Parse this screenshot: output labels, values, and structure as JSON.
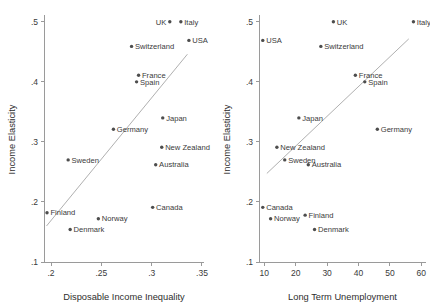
{
  "figure": {
    "panels": [
      {
        "id": "left",
        "xlabel": "Disposable Income Inequality",
        "ylabel": "Income Elasticity",
        "xticks": [
          ".2",
          ".25",
          ".3",
          ".35"
        ],
        "xtickvals": [
          0.2,
          0.25,
          0.3,
          0.35
        ],
        "yticks": [
          ".1",
          ".2",
          ".3",
          ".4",
          ".5"
        ],
        "ytickvals": [
          0.1,
          0.2,
          0.3,
          0.4,
          0.5
        ]
      },
      {
        "id": "right",
        "xlabel": "Long Term Unemployment",
        "ylabel": "Income Elasticity",
        "xticks": [
          "10",
          "20",
          "30",
          "40",
          "50",
          "60"
        ],
        "xtickvals": [
          10,
          20,
          30,
          40,
          50,
          60
        ],
        "yticks": [
          ".1",
          ".2",
          ".3",
          ".4",
          ".5"
        ],
        "ytickvals": [
          0.1,
          0.2,
          0.3,
          0.4,
          0.5
        ]
      }
    ]
  },
  "chart_data": [
    {
      "type": "scatter",
      "panel": "left",
      "title": "",
      "xlabel": "Disposable Income Inequality",
      "ylabel": "Income Elasticity",
      "xlim": [
        0.193,
        0.352
      ],
      "ylim": [
        0.1,
        0.508
      ],
      "grid": false,
      "legend": false,
      "point_labels": true,
      "fit_line": {
        "x": [
          0.1955,
          0.3355
        ],
        "y": [
          0.16,
          0.446
        ]
      },
      "points": [
        {
          "label": "UK",
          "x": 0.318,
          "y": 0.5,
          "side": "left"
        },
        {
          "label": "Italy",
          "x": 0.329,
          "y": 0.5,
          "side": "right"
        },
        {
          "label": "USA",
          "x": 0.337,
          "y": 0.469,
          "side": "right"
        },
        {
          "label": "Switzerland",
          "x": 0.28,
          "y": 0.459,
          "side": "right"
        },
        {
          "label": "France",
          "x": 0.287,
          "y": 0.411,
          "side": "right"
        },
        {
          "label": "Spain",
          "x": 0.285,
          "y": 0.4,
          "side": "right"
        },
        {
          "label": "Japan",
          "x": 0.311,
          "y": 0.34,
          "side": "right"
        },
        {
          "label": "Germany",
          "x": 0.262,
          "y": 0.321,
          "side": "right"
        },
        {
          "label": "New Zealand",
          "x": 0.31,
          "y": 0.291,
          "side": "right"
        },
        {
          "label": "Australia",
          "x": 0.304,
          "y": 0.262,
          "side": "right"
        },
        {
          "label": "Sweden",
          "x": 0.217,
          "y": 0.27,
          "side": "right"
        },
        {
          "label": "Canada",
          "x": 0.301,
          "y": 0.191,
          "side": "right"
        },
        {
          "label": "Finland",
          "x": 0.196,
          "y": 0.182,
          "side": "right"
        },
        {
          "label": "Norway",
          "x": 0.247,
          "y": 0.172,
          "side": "right"
        },
        {
          "label": "Denmark",
          "x": 0.219,
          "y": 0.154,
          "side": "right"
        }
      ]
    },
    {
      "type": "scatter",
      "panel": "right",
      "title": "",
      "xlabel": "Long Term Unemployment",
      "ylabel": "Income Elasticity",
      "xlim": [
        8.3,
        61.5
      ],
      "ylim": [
        0.1,
        0.508
      ],
      "grid": false,
      "legend": false,
      "point_labels": true,
      "fit_line": {
        "x": [
          10.8,
          56.0
        ],
        "y": [
          0.2475,
          0.4715
        ]
      },
      "points": [
        {
          "label": "UK",
          "x": 32.0,
          "y": 0.5,
          "side": "right"
        },
        {
          "label": "Italy",
          "x": 57.5,
          "y": 0.5,
          "side": "right"
        },
        {
          "label": "USA",
          "x": 9.5,
          "y": 0.469,
          "side": "right"
        },
        {
          "label": "Switzerland",
          "x": 28.0,
          "y": 0.459,
          "side": "right"
        },
        {
          "label": "France",
          "x": 39.0,
          "y": 0.411,
          "side": "right"
        },
        {
          "label": "Spain",
          "x": 42.0,
          "y": 0.4,
          "side": "right"
        },
        {
          "label": "Germany",
          "x": 46.0,
          "y": 0.321,
          "side": "right"
        },
        {
          "label": "Japan",
          "x": 21.0,
          "y": 0.34,
          "side": "right"
        },
        {
          "label": "New Zealand",
          "x": 14.0,
          "y": 0.291,
          "side": "right"
        },
        {
          "label": "Sweden",
          "x": 16.5,
          "y": 0.27,
          "side": "right"
        },
        {
          "label": "Australia",
          "x": 24.0,
          "y": 0.262,
          "side": "right"
        },
        {
          "label": "Canada",
          "x": 9.5,
          "y": 0.191,
          "side": "right"
        },
        {
          "label": "Norway",
          "x": 12.0,
          "y": 0.172,
          "side": "right"
        },
        {
          "label": "Finland",
          "x": 23.0,
          "y": 0.178,
          "side": "right"
        },
        {
          "label": "Denmark",
          "x": 26.0,
          "y": 0.154,
          "side": "right"
        }
      ]
    }
  ]
}
